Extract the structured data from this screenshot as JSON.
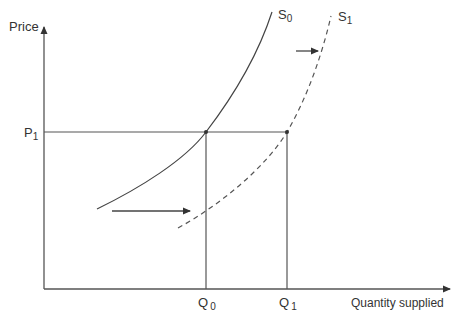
{
  "diagram": {
    "title": "",
    "axes": {
      "y_label": "Price",
      "x_label": "Quantity supplied"
    },
    "price_level": {
      "label": "P",
      "subscript": "1"
    },
    "quantities": [
      {
        "label": "Q",
        "subscript": "0"
      },
      {
        "label": "Q",
        "subscript": "1"
      }
    ],
    "curves": [
      {
        "label": "S",
        "subscript": "0",
        "style": "solid"
      },
      {
        "label": "S",
        "subscript": "1",
        "style": "dashed"
      }
    ],
    "arrows": [
      "shift-right-lower",
      "shift-right-upper"
    ],
    "colors": {
      "line": "#444444",
      "text": "#333333",
      "background": "#ffffff"
    }
  }
}
